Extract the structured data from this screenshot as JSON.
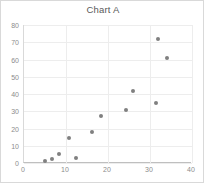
{
  "chart_data": {
    "type": "scatter",
    "title": "Chart A",
    "xlabel": "",
    "ylabel": "",
    "xlim": [
      0,
      40
    ],
    "ylim": [
      0,
      80
    ],
    "xticks": [
      0,
      10,
      20,
      30,
      40
    ],
    "yticks": [
      0,
      10,
      20,
      30,
      40,
      50,
      60,
      70,
      80
    ],
    "grid": true,
    "legend": false,
    "series": [
      {
        "name": "Series 1",
        "marker_color": "#808080",
        "points": [
          {
            "x": 5,
            "y": 1
          },
          {
            "x": 6.7,
            "y": 2.3
          },
          {
            "x": 8.3,
            "y": 5
          },
          {
            "x": 10.7,
            "y": 14.5
          },
          {
            "x": 12.4,
            "y": 3
          },
          {
            "x": 16.2,
            "y": 18
          },
          {
            "x": 18.3,
            "y": 27
          },
          {
            "x": 24.3,
            "y": 30.7
          },
          {
            "x": 26,
            "y": 42
          },
          {
            "x": 31.4,
            "y": 35
          },
          {
            "x": 31.9,
            "y": 72
          },
          {
            "x": 34,
            "y": 61
          }
        ]
      }
    ],
    "colors": {
      "marker": "#808080",
      "grid": "#ededed",
      "axis": "#bfbfbf",
      "tick_label": "#8c8c8c",
      "title": "#595959",
      "border": "#d9d9d9",
      "background": "#ffffff"
    }
  }
}
